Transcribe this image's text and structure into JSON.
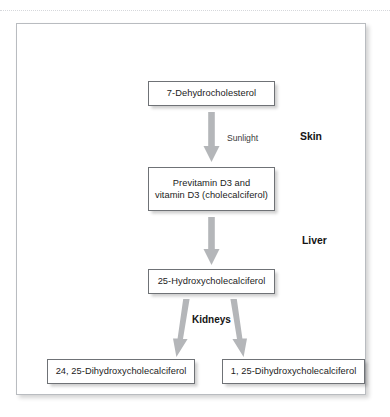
{
  "figure": {
    "type": "flow-diagram",
    "nodes": [
      {
        "id": "dehydrocholesterol",
        "label": "7-Dehydrocholesterol"
      },
      {
        "id": "previtamin",
        "label": "Previtamin D3 and\nvitamin D3 (cholecalciferol)",
        "line1": "Previtamin D3 and",
        "line2": "vitamin D3 (cholecalciferol)"
      },
      {
        "id": "hydroxy",
        "label": "25-Hydroxycholecalciferol"
      },
      {
        "id": "dihydroxy_24_25",
        "label": "24, 25-Dihydroxycholecalciferol"
      },
      {
        "id": "dihydroxy_1_25",
        "label": "1, 25-Dihydroxycholecalciferol"
      }
    ],
    "edge_labels": {
      "sunlight": "Sunlight",
      "kidneys": "Kidneys"
    },
    "organ_labels": {
      "skin": "Skin",
      "liver": "Liver"
    },
    "colors": {
      "arrow": "#b4b6b9",
      "box_border": "#6f7276",
      "frame_border": "#b9bcc0",
      "text": "#1b1b1b",
      "background": "#ffffff"
    }
  }
}
